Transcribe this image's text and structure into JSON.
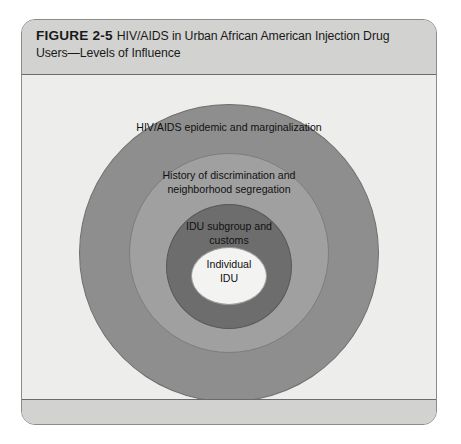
{
  "figure": {
    "label": "FIGURE 2-5",
    "title": "HIV/AIDS in Urban African American Injection Drug Users—Levels of Influence"
  },
  "diagram": {
    "type": "concentric-circles",
    "rings": [
      {
        "level": 1,
        "name": "outermost",
        "label": "HIV/AIDS epidemic and marginalization",
        "color": "#8e8e8e"
      },
      {
        "level": 2,
        "name": "second",
        "label": "History of discrimination and\nneighborhood segregation",
        "color": "#a0a0a0"
      },
      {
        "level": 3,
        "name": "third",
        "label": "IDU subgroup and\ncustoms",
        "color": "#6d6d6d"
      },
      {
        "level": 4,
        "name": "innermost",
        "label": "Individual\nIDU",
        "color": "#f3f3f1"
      }
    ]
  },
  "colors": {
    "panel_background": "#ededeb",
    "header_background": "#d2d2d0",
    "border": "#8c8c8c",
    "text": "#1a1a1a"
  }
}
